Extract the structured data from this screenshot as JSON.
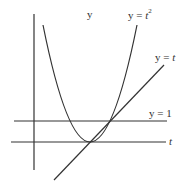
{
  "diagram": {
    "labels": {
      "y_axis": "y",
      "t_axis": "t",
      "parabola_prefix": "y = ",
      "parabola_var": "t",
      "parabola_exp": "2",
      "line_prefix": "y = ",
      "line_var": "t",
      "horizontal": "y = 1"
    },
    "curves": [
      {
        "name": "parabola",
        "equation": "y = t^2"
      },
      {
        "name": "line",
        "equation": "y = t"
      },
      {
        "name": "horizontal",
        "equation": "y = 1"
      }
    ],
    "colors": {
      "stroke": "#333333",
      "background": "#ffffff"
    }
  }
}
